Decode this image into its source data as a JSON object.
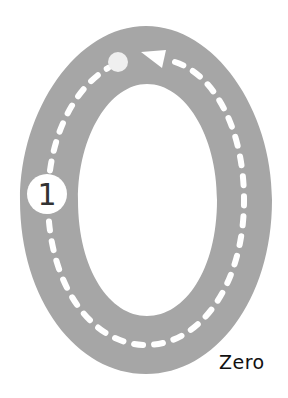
{
  "diagram": {
    "numeral": "0",
    "label": "Zero",
    "start_marker": "1",
    "colors": {
      "track": "#a6a6a6",
      "dashes": "#ffffff",
      "background": "#ffffff",
      "text": "#111111"
    },
    "icons": [
      "start-circle-icon",
      "direction-arrow-icon",
      "end-dot-icon"
    ]
  }
}
